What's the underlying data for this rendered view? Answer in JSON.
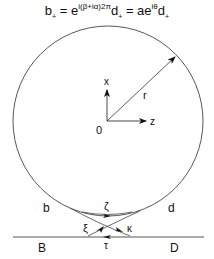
{
  "equation": {
    "lhs": "b",
    "lhs_sub": "+",
    "eq1": " = e",
    "exp1": "i(β+iα)2π",
    "mid": "d",
    "mid_sub": "+",
    "eq2": " = ae",
    "exp2": "iθ",
    "rhs": "d",
    "rhs_sub": "+"
  },
  "labels": {
    "x_axis": "x",
    "z_axis": "z",
    "origin": "0",
    "radius": "r",
    "b": "b",
    "d": "d",
    "B": "B",
    "D": "D",
    "zeta": "ζ",
    "xi": "ξ",
    "kappa": "κ",
    "tau": "τ"
  },
  "colors": {
    "line": "#333333",
    "text": "#111111"
  }
}
